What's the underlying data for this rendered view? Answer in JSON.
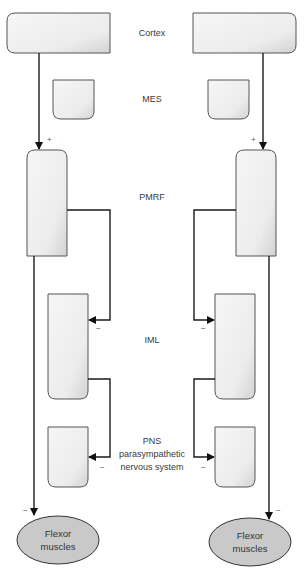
{
  "diagram": {
    "labels": {
      "cortex": "Cortex",
      "mes": "MES",
      "pmrf": "PMRF",
      "iml": "IML",
      "pns_line1": "PNS",
      "pns_line2": "parasympathetic",
      "pns_line3": "nervous system"
    },
    "effector": {
      "line1": "Flexor",
      "line2": "muscles"
    },
    "signs": {
      "excitatory": "+",
      "inhibitory": "−"
    },
    "colors": {
      "box_fill_top": "#f4f4f4",
      "box_fill_bottom": "#dcdcdc",
      "box_stroke": "#555555",
      "ellipse_fill": "#c9c9c9",
      "wire": "#1a1a1a"
    },
    "sides": [
      "left",
      "right"
    ]
  }
}
